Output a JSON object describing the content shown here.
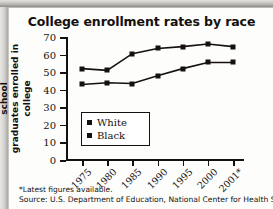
{
  "chart_data": {
    "type": "line",
    "title": "College enrollment rates by race",
    "xlabel": "",
    "ylabel": "Percentage of high school graduates enrolled in college",
    "ylabel_lines": [
      "Percentage of high school",
      "graduates enrolled in college"
    ],
    "categories": [
      "1975",
      "1980",
      "1985",
      "1990",
      "1995",
      "2000",
      "2001*"
    ],
    "yticks": [
      0,
      10,
      20,
      30,
      40,
      50,
      60,
      70
    ],
    "ylim": [
      0,
      70
    ],
    "grid": false,
    "legend_position": "inside-left",
    "series": [
      {
        "name": "White",
        "values": [
          52,
          51,
          60.5,
          63.5,
          64.5,
          66,
          64.5
        ]
      },
      {
        "name": "Black",
        "values": [
          43,
          44,
          43.5,
          48,
          52,
          55.5,
          55.5
        ]
      }
    ],
    "marker": "square",
    "line_color": "#15110f"
  },
  "legend": {
    "items": [
      {
        "label": "White"
      },
      {
        "label": "Black"
      }
    ]
  },
  "footnotes": {
    "note": "*Latest figures available.",
    "source": "Source: U.S. Department of Education, National Center for Health Statistics,"
  }
}
